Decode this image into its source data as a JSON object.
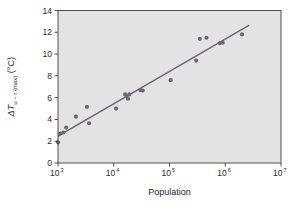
{
  "chart_data": {
    "type": "scatter",
    "title": "",
    "subtitle": "",
    "xlabel": "Population",
    "ylabel": "ΔTₓ₋ᵣ (max) (°C)",
    "ylabel_main": "ΔT",
    "ylabel_subscript": "u − r (max)",
    "ylabel_units": "(°C)",
    "xscale": "log",
    "yscale": "linear",
    "xlim": [
      1000,
      10000000
    ],
    "ylim": [
      0,
      14
    ],
    "grid": false,
    "legend": false,
    "xticks": [
      1000,
      10000,
      100000,
      1000000,
      10000000
    ],
    "xtick_labels": [
      "10³",
      "10⁴",
      "10⁵",
      "10⁶",
      "10⁷"
    ],
    "xtick_base": "10",
    "xtick_exponents": [
      "3",
      "4",
      "5",
      "6",
      "7"
    ],
    "yticks": [
      0,
      2,
      4,
      6,
      8,
      10,
      12,
      14
    ],
    "ytick_labels": [
      "0",
      "2",
      "4",
      "6",
      "8",
      "10",
      "12",
      "14"
    ],
    "marker": "circle",
    "marker_color": "#6e6775",
    "line_color": "#6e6775",
    "plot_background": "#e4e3e4",
    "axis_color": "#3c3c3c",
    "points": [
      {
        "x": 1000,
        "y": 1.9
      },
      {
        "x": 1100,
        "y": 2.7
      },
      {
        "x": 1250,
        "y": 2.8
      },
      {
        "x": 1400,
        "y": 3.25
      },
      {
        "x": 2100,
        "y": 4.25
      },
      {
        "x": 3300,
        "y": 5.15
      },
      {
        "x": 3600,
        "y": 3.65
      },
      {
        "x": 11000,
        "y": 5.0
      },
      {
        "x": 16000,
        "y": 6.3
      },
      {
        "x": 17000,
        "y": 6.15
      },
      {
        "x": 18000,
        "y": 5.9
      },
      {
        "x": 19000,
        "y": 6.3
      },
      {
        "x": 30000,
        "y": 6.7
      },
      {
        "x": 33000,
        "y": 6.65
      },
      {
        "x": 105000,
        "y": 7.6
      },
      {
        "x": 300000,
        "y": 9.4
      },
      {
        "x": 350000,
        "y": 11.4
      },
      {
        "x": 460000,
        "y": 11.5
      },
      {
        "x": 800000,
        "y": 11.0
      },
      {
        "x": 900000,
        "y": 11.05
      },
      {
        "x": 2000000,
        "y": 11.8
      }
    ],
    "fit_line": {
      "type": "linear-in-log-x",
      "x_start": 700,
      "y_start": 2.0,
      "x_end": 2700000,
      "y_end": 12.65
    }
  }
}
